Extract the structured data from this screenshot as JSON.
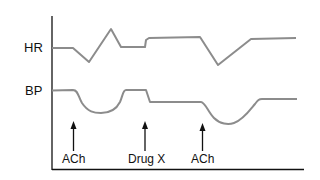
{
  "diagram": {
    "type": "physiological recording",
    "traces": [
      {
        "name": "HR",
        "label": "HR",
        "color": "#8c8c8c"
      },
      {
        "name": "BP",
        "label": "BP",
        "color": "#8c8c8c"
      }
    ],
    "events": [
      {
        "label": "ACh",
        "x": 73
      },
      {
        "label": "Drug X",
        "x": 145
      },
      {
        "label": "ACh",
        "x": 202
      }
    ],
    "colors": {
      "trace": "#8c8c8c",
      "axis": "#111111",
      "arrow": "#111111"
    }
  }
}
